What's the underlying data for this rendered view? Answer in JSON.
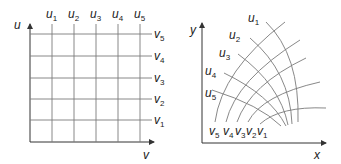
{
  "colors": {
    "axis": "#333333",
    "grid": "#7a7a7a",
    "text": "#222222",
    "background": "#ffffff"
  },
  "left_panel": {
    "axis_vertical_label": "u",
    "axis_horizontal_label": "v",
    "u_lines": [
      {
        "base": "u",
        "sub": "1"
      },
      {
        "base": "u",
        "sub": "2"
      },
      {
        "base": "u",
        "sub": "3"
      },
      {
        "base": "u",
        "sub": "4"
      },
      {
        "base": "u",
        "sub": "5"
      }
    ],
    "v_lines": [
      {
        "base": "v",
        "sub": "5"
      },
      {
        "base": "v",
        "sub": "4"
      },
      {
        "base": "v",
        "sub": "3"
      },
      {
        "base": "v",
        "sub": "2"
      },
      {
        "base": "v",
        "sub": "1"
      }
    ]
  },
  "right_panel": {
    "axis_vertical_label": "y",
    "axis_horizontal_label": "x",
    "u_curves": [
      {
        "base": "u",
        "sub": "1"
      },
      {
        "base": "u",
        "sub": "2"
      },
      {
        "base": "u",
        "sub": "3"
      },
      {
        "base": "u",
        "sub": "4"
      },
      {
        "base": "u",
        "sub": "5"
      }
    ],
    "v_curves": [
      {
        "base": "v",
        "sub": "5"
      },
      {
        "base": "v",
        "sub": "4"
      },
      {
        "base": "v",
        "sub": "3"
      },
      {
        "base": "v",
        "sub": "2"
      },
      {
        "base": "v",
        "sub": "1"
      }
    ]
  }
}
